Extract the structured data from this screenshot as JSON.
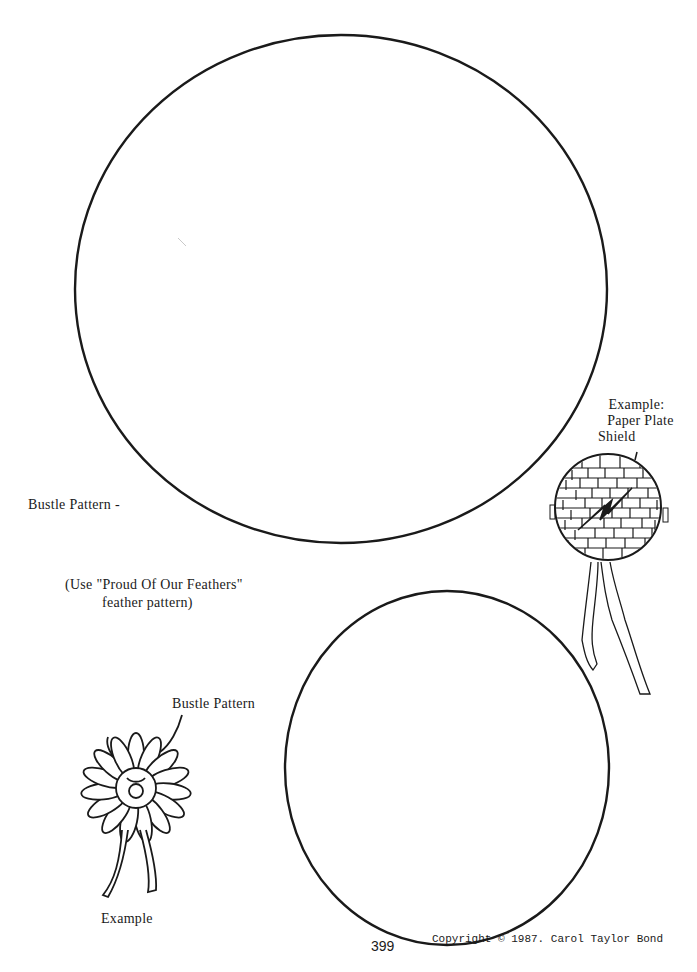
{
  "page": {
    "number": "399",
    "copyright": "Copyright © 1987.  Carol Taylor Bond"
  },
  "labels": {
    "bustle_pattern_large": "Bustle Pattern -",
    "use_note_line1": "(Use \"Proud Of Our Feathers\"",
    "use_note_line2": "feather pattern)",
    "bustle_pattern_small": "Bustle Pattern",
    "example_bustle": "Example",
    "shield_line1": "Example:",
    "shield_line2": "Paper Plate",
    "shield_line3": "Shield"
  },
  "shapes": {
    "large_circle": {
      "cx": 341,
      "cy": 289,
      "rx": 266,
      "ry": 254
    },
    "small_circle": {
      "cx": 447,
      "cy": 768,
      "rx": 162,
      "ry": 177
    },
    "stroke_color": "#1a1a1a"
  }
}
